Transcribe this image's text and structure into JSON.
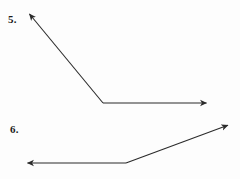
{
  "page": {
    "background_color": "#fdfdfd",
    "width": 240,
    "height": 179
  },
  "style": {
    "stroke_color": "#2b2b2b",
    "stroke_width": 1.1,
    "label_color": "#1b1b1b"
  },
  "figures": [
    {
      "label": "5.",
      "label_position": {
        "x": 8,
        "y": 14
      },
      "name": "angle-figure-5",
      "type": "angle",
      "vertex": {
        "x": 103,
        "y": 103
      },
      "rays": [
        {
          "name": "ray-up-left",
          "from": {
            "x": 103,
            "y": 103
          },
          "to": {
            "x": 27,
            "y": 11
          },
          "arrowhead": "end"
        },
        {
          "name": "ray-right",
          "from": {
            "x": 103,
            "y": 103
          },
          "to": {
            "x": 210,
            "y": 103
          },
          "arrowhead": "end"
        }
      ]
    },
    {
      "label": "6.",
      "label_position": {
        "x": 10,
        "y": 124
      },
      "name": "angle-figure-6",
      "type": "angle",
      "vertex": {
        "x": 126,
        "y": 163
      },
      "rays": [
        {
          "name": "ray-left",
          "from": {
            "x": 126,
            "y": 163
          },
          "to": {
            "x": 24,
            "y": 163
          },
          "arrowhead": "end"
        },
        {
          "name": "ray-up-right",
          "from": {
            "x": 126,
            "y": 163
          },
          "to": {
            "x": 231,
            "y": 124
          },
          "arrowhead": "end"
        }
      ]
    }
  ]
}
